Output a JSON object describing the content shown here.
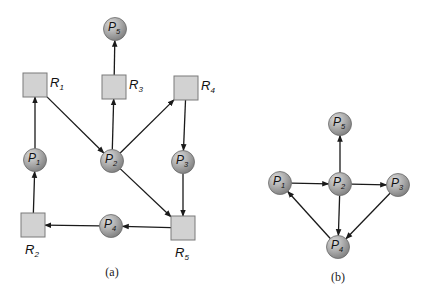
{
  "figure_a": {
    "caption": "(a)",
    "resources": [
      {
        "id": "R1",
        "name": "R",
        "sub": "1",
        "x": 35,
        "y": 85,
        "label_pos": "right"
      },
      {
        "id": "R2",
        "name": "R",
        "sub": "2",
        "x": 33,
        "y": 225,
        "label_pos": "below"
      },
      {
        "id": "R3",
        "name": "R",
        "sub": "3",
        "x": 114,
        "y": 87,
        "label_pos": "right"
      },
      {
        "id": "R4",
        "name": "R",
        "sub": "4",
        "x": 186,
        "y": 88,
        "label_pos": "right"
      },
      {
        "id": "R5",
        "name": "R",
        "sub": "5",
        "x": 183,
        "y": 228,
        "label_pos": "below"
      }
    ],
    "processes": [
      {
        "id": "P1",
        "name": "P",
        "sub": "1",
        "x": 35,
        "y": 160
      },
      {
        "id": "P2",
        "name": "P",
        "sub": "2",
        "x": 112,
        "y": 161
      },
      {
        "id": "P3",
        "name": "P",
        "sub": "3",
        "x": 183,
        "y": 162
      },
      {
        "id": "P4",
        "name": "P",
        "sub": "4",
        "x": 111,
        "y": 226
      },
      {
        "id": "P5",
        "name": "P",
        "sub": "5",
        "x": 115,
        "y": 29
      }
    ],
    "edges": [
      {
        "from": "P1",
        "to": "R1"
      },
      {
        "from": "R1",
        "to": "P2"
      },
      {
        "from": "P2",
        "to": "R3"
      },
      {
        "from": "R3",
        "to": "P5"
      },
      {
        "from": "P2",
        "to": "R4"
      },
      {
        "from": "R4",
        "to": "P3"
      },
      {
        "from": "P2",
        "to": "R5"
      },
      {
        "from": "P3",
        "to": "R5"
      },
      {
        "from": "R5",
        "to": "P4"
      },
      {
        "from": "P4",
        "to": "R2"
      },
      {
        "from": "R2",
        "to": "P1"
      }
    ]
  },
  "figure_b": {
    "caption": "(b)",
    "processes": [
      {
        "id": "P1",
        "name": "P",
        "sub": "1",
        "x": 280,
        "y": 183
      },
      {
        "id": "P2",
        "name": "P",
        "sub": "2",
        "x": 340,
        "y": 184
      },
      {
        "id": "P3",
        "name": "P",
        "sub": "3",
        "x": 398,
        "y": 185
      },
      {
        "id": "P4",
        "name": "P",
        "sub": "4",
        "x": 338,
        "y": 247
      },
      {
        "id": "P5",
        "name": "P",
        "sub": "5",
        "x": 340,
        "y": 124
      }
    ],
    "edges": [
      {
        "from": "P1",
        "to": "P2"
      },
      {
        "from": "P2",
        "to": "P5"
      },
      {
        "from": "P2",
        "to": "P3"
      },
      {
        "from": "P2",
        "to": "P4"
      },
      {
        "from": "P3",
        "to": "P4"
      },
      {
        "from": "P4",
        "to": "P1"
      }
    ]
  },
  "style": {
    "process_fill_light": "#d4d4d4",
    "process_fill_dark": "#8a8a8a",
    "process_stroke": "#6a6a6a",
    "resource_fill": "#d2d2d2",
    "resource_stroke": "#7a7a7a",
    "edge_color": "#1a1a1a"
  }
}
